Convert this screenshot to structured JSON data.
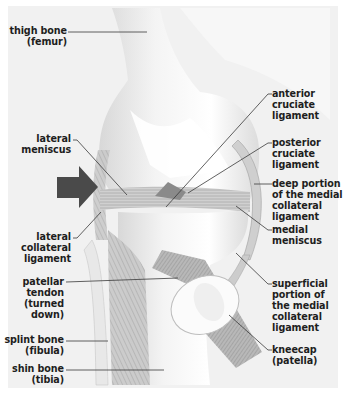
{
  "diagram": {
    "arrow": {
      "direction": "right",
      "color": "#4a4a4a",
      "meaning": "direction-indicator"
    },
    "colors": {
      "background": "#f1f1f1",
      "text": "#1e1e1e",
      "leader_line": "#3a3a3a"
    },
    "labels_left": [
      {
        "id": "thigh-bone",
        "lines": [
          "thigh bone",
          "(femur)"
        ]
      },
      {
        "id": "lateral-meniscus",
        "lines": [
          "lateral",
          "meniscus"
        ]
      },
      {
        "id": "lateral-collateral-ligament",
        "lines": [
          "lateral",
          "collateral",
          "ligament"
        ]
      },
      {
        "id": "patellar-tendon",
        "lines": [
          "patellar",
          "tendon",
          "(turned",
          "down)"
        ]
      },
      {
        "id": "splint-bone",
        "lines": [
          "splint bone",
          "(fibula)"
        ]
      },
      {
        "id": "shin-bone",
        "lines": [
          "shin bone",
          "(tibia)"
        ]
      }
    ],
    "labels_right": [
      {
        "id": "anterior-cruciate-ligament",
        "lines": [
          "anterior",
          "cruciate",
          "ligament"
        ]
      },
      {
        "id": "posterior-cruciate-ligament",
        "lines": [
          "posterior",
          "cruciate",
          "ligament"
        ]
      },
      {
        "id": "deep-medial-collateral-ligament",
        "lines": [
          "deep portion",
          "of the medial",
          "collateral",
          "ligament"
        ]
      },
      {
        "id": "medial-meniscus",
        "lines": [
          "medial",
          "meniscus"
        ]
      },
      {
        "id": "superficial-medial-collateral-ligament",
        "lines": [
          "superficial",
          "portion of",
          "the medial",
          "collateral",
          "ligament"
        ]
      },
      {
        "id": "kneecap",
        "lines": [
          "kneecap",
          "(patella)"
        ]
      }
    ]
  }
}
